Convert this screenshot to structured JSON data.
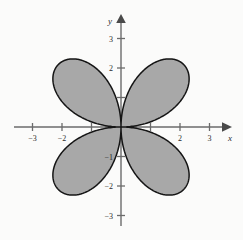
{
  "figure": {
    "background_color": "#fbfbfa",
    "width": 243,
    "height": 240
  },
  "chart_data": {
    "type": "line",
    "title": "",
    "subtitle": "",
    "xlabel": "x",
    "ylabel": "y",
    "xlim": [
      -3.6,
      3.6
    ],
    "ylim": [
      -3.6,
      3.6
    ],
    "grid": false,
    "legend": null,
    "curve_name": "four-petaled rose",
    "polar_equation": "r = 3 sin(2θ)",
    "amplitude": 3,
    "petal_count": 4,
    "fill_color": "#a8a8a8",
    "stroke_color": "#151515",
    "axis_color": "#6b6b6b",
    "petals": [
      {
        "name": "upper-right-petal",
        "quadrant": 1,
        "tip_polar_angle_deg": 45,
        "tip_x": 2.12,
        "tip_y": 2.12
      },
      {
        "name": "upper-left-petal",
        "quadrant": 2,
        "tip_polar_angle_deg": 135,
        "tip_x": -2.12,
        "tip_y": 2.12
      },
      {
        "name": "lower-left-petal",
        "quadrant": 3,
        "tip_polar_angle_deg": 225,
        "tip_x": -2.12,
        "tip_y": -2.12
      },
      {
        "name": "lower-right-petal",
        "quadrant": 4,
        "tip_polar_angle_deg": 315,
        "tip_x": 2.12,
        "tip_y": -2.12
      }
    ],
    "x_ticks": [
      {
        "value": -3,
        "label": "−3"
      },
      {
        "value": -2,
        "label": "−2"
      },
      {
        "value": -1,
        "label": ""
      },
      {
        "value": 1,
        "label": ""
      },
      {
        "value": 2,
        "label": "2"
      },
      {
        "value": 3,
        "label": "3"
      }
    ],
    "y_ticks": [
      {
        "value": 3,
        "label": "3"
      },
      {
        "value": 2,
        "label": "2"
      },
      {
        "value": 1,
        "label": ""
      },
      {
        "value": -1,
        "label": "−1"
      },
      {
        "value": -2,
        "label": "−2"
      },
      {
        "value": -3,
        "label": "−3"
      }
    ]
  },
  "axes": {
    "x_axis_label": "x",
    "y_axis_label": "y"
  }
}
